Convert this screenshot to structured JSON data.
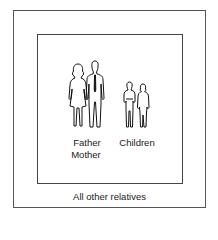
{
  "diagram": {
    "inner_box": {
      "labels": {
        "parents_line1": "Father",
        "parents_line2": "Mother",
        "children": "Children"
      },
      "figures": [
        "mother-figure",
        "father-figure",
        "boy-figure",
        "girl-figure"
      ]
    },
    "outer_box": {
      "label": "All other relatives"
    }
  }
}
